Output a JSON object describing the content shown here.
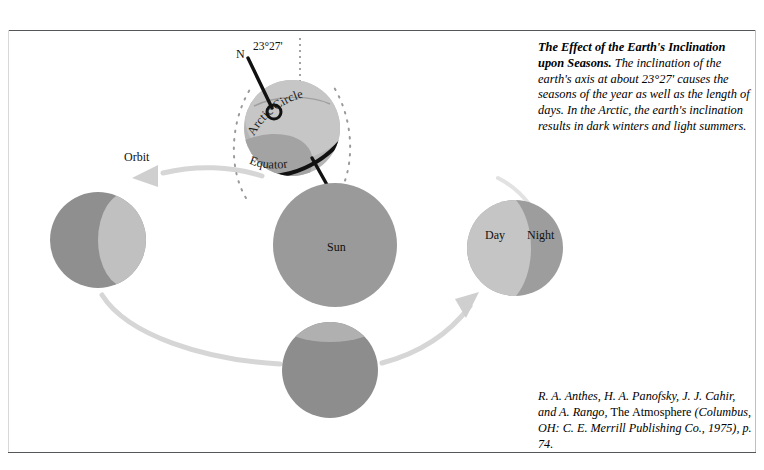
{
  "figure": {
    "title": "The Effect of the Earth's Inclination upon Seasons",
    "caption": {
      "lead": "The Effect of the Earth's Inclination upon Seasons.",
      "body": " The inclination of the earth's axis at about 23°27' causes the seasons of the year as well as the length of days. In the Arctic, the earth's inclination results in dark winters and light summers."
    },
    "citation": {
      "authors": "R. A. Anthes, H. A. Panofsky, J. J. Cahir, and A. Rango, ",
      "work": "The Atmosphere",
      "publication": " (Columbus, OH: C. E. Merrill Publishing Co., 1975), p. 74."
    }
  },
  "diagram": {
    "labels": {
      "north_pole": "N",
      "axial_tilt": "23°27'",
      "arctic_circle": "Arctic Circle",
      "equator": "Equator",
      "orbit": "Orbit",
      "sun": "Sun",
      "day": "Day",
      "night": "Night"
    },
    "colors": {
      "sun_fill": "#9a9a9a",
      "earth_light": "#c5c5c5",
      "earth_dark": "#8f8f8f",
      "orbit_arrow": "#d4d4d4",
      "axis_line": "#111111",
      "dotted_arc": "#9a9a9a",
      "frame_rule": "#55585a"
    },
    "bodies": [
      {
        "name": "earth-top-tilted",
        "cx": 292,
        "cy": 128,
        "r": 48,
        "lit": "upper-left"
      },
      {
        "name": "earth-left",
        "cx": 98,
        "cy": 240,
        "r": 48,
        "lit": "right-crescent"
      },
      {
        "name": "sun-center",
        "cx": 335,
        "cy": 245,
        "r": 62,
        "lit": "uniform"
      },
      {
        "name": "earth-right",
        "cx": 515,
        "cy": 248,
        "r": 48,
        "lit": "left-day"
      },
      {
        "name": "earth-bottom",
        "cx": 330,
        "cy": 370,
        "r": 48,
        "lit": "dark"
      }
    ],
    "orbit": {
      "direction": "counterclockwise",
      "arrow_left": "down-left",
      "arrow_right": "up-right"
    }
  }
}
